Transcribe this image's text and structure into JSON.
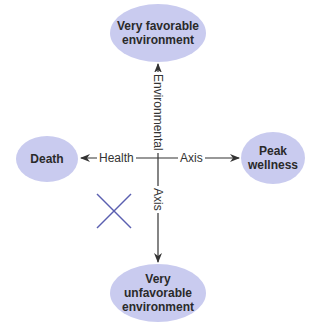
{
  "diagram": {
    "nodes": {
      "top": "Very favorable environment",
      "bottom": "Very unfavorable environment",
      "left": "Death",
      "right_line1": "Peak",
      "right_line2": "wellness",
      "top_line1": "Very favorable",
      "top_line2": "environment",
      "bottom_line1": "Very unfavorable",
      "bottom_line2": "environment"
    },
    "axis_labels": {
      "horizontal_left": "Health",
      "horizontal_right": "Axis",
      "vertical_top": "Environmental",
      "vertical_bottom": "Axis"
    },
    "marker": "X",
    "colors": {
      "node_fill": "#c9cbef",
      "axis": "#333333",
      "marker": "#5a5fb0"
    }
  }
}
